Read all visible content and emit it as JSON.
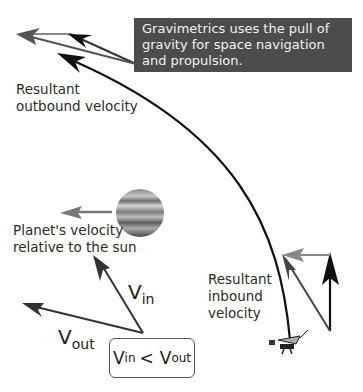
{
  "caption": {
    "lines": [
      "Gravimetrics uses the pull of",
      "gravity for space navigation",
      "and propulsion."
    ],
    "background": "#4c4c4c",
    "text_color": "#f2f2f2"
  },
  "labels": {
    "outbound": [
      "Resultant",
      "outbound velocity"
    ],
    "planet": [
      "Planet's velocity",
      "relative to the sun"
    ],
    "inbound": [
      "Resultant",
      "inbound",
      "velocity"
    ]
  },
  "vectors": {
    "v_in": {
      "symbol": "V",
      "sub": "in"
    },
    "v_out": {
      "symbol": "V",
      "sub": "out"
    }
  },
  "inequality": {
    "left_symbol": "V",
    "left_sub": "in",
    "operator": "<",
    "right_symbol": "V",
    "right_sub": "out"
  },
  "icons": {
    "planet": "jupiter-like-planet",
    "spacecraft": "probe-spacecraft"
  }
}
